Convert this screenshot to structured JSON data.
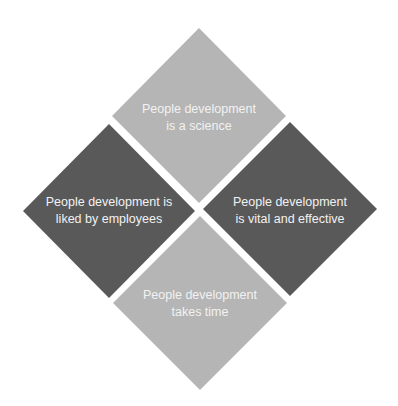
{
  "diagram": {
    "type": "four-diamond-matrix",
    "colors": {
      "light": "#b5b5b5",
      "dark": "#595959",
      "text": "#f2f2f2",
      "background": "#ffffff"
    },
    "diamonds": [
      {
        "position": "top",
        "line1": "People development",
        "line2": "is a science",
        "shade": "light"
      },
      {
        "position": "left",
        "line1": "People development is",
        "line2": "liked by employees",
        "shade": "dark"
      },
      {
        "position": "right",
        "line1": "People development",
        "line2": "is vital and effective",
        "shade": "dark"
      },
      {
        "position": "bottom",
        "line1": "People development",
        "line2": "takes time",
        "shade": "light"
      }
    ]
  }
}
